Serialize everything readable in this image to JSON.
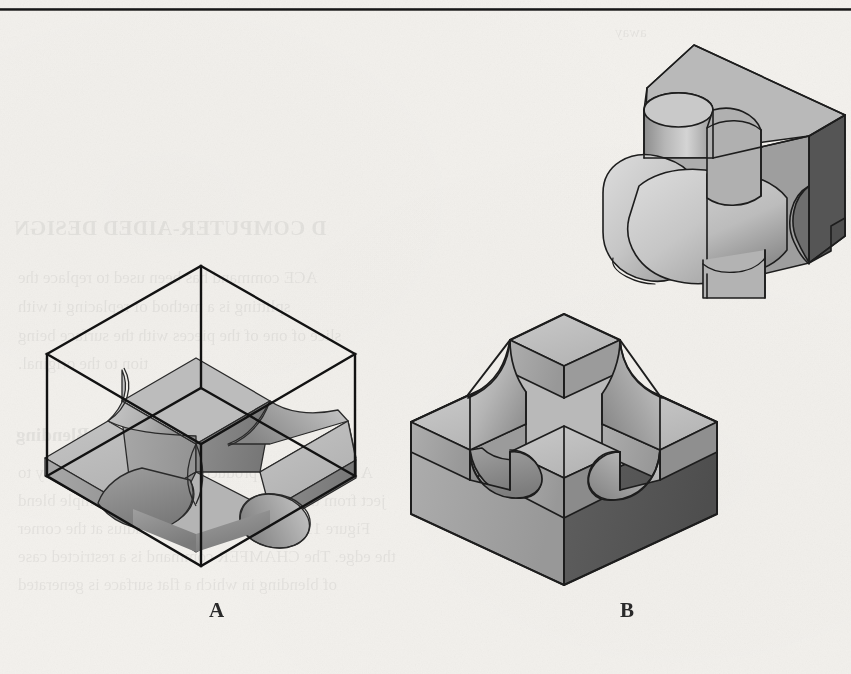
{
  "page": {
    "background_color": "#f3f1ed",
    "rule_color": "#151515",
    "width": 851,
    "height": 674
  },
  "figure": {
    "labels": [
      {
        "id": "label-a",
        "text": "A",
        "x": 209,
        "y": 598
      },
      {
        "id": "label-b",
        "text": "B",
        "x": 620,
        "y": 598
      }
    ],
    "objects": [
      {
        "id": "object-top-right",
        "name": "isometric-block-with-cylindrical-bosses",
        "description": "Isometric solid block with a vertical cylindrical boss and a horizontal cylindrical/spherical protrusion intersecting it"
      },
      {
        "id": "object-a",
        "name": "wireframe-cube-with-cross-solid",
        "description": "Isometric wireframe bounding cube enclosing a shaded plus/cross shaped solid with concave fillet cutouts"
      },
      {
        "id": "object-b",
        "name": "block-with-raised-cross-boss",
        "description": "Solid isometric rectangular block with a raised cross shaped boss and curved fillets at the corners"
      }
    ]
  },
  "shading": {
    "top_face": "#bdbdbd",
    "top_face_light": "#cfcfcf",
    "left_face": "#a2a2a2",
    "left_face_dark": "#8e8e8e",
    "right_face": "#5a5a5a",
    "right_face_dark": "#4d4d4d",
    "curve_light": "#d2d2d2",
    "curve_dark": "#8b8b8b",
    "outline": "#1e1e1e",
    "wire": "#141414"
  },
  "ghost_text": {
    "note": "Faint show-through text from the reverse side of the printed page",
    "lines": [
      {
        "text": "D COMPUTER-AIDED DESIGN",
        "x": 14,
        "y": 216,
        "size": 21,
        "style": "head"
      },
      {
        "text": "ACE command has been used to replace the",
        "x": 18,
        "y": 268,
        "size": 17,
        "style": ""
      },
      {
        "text": "splitting is a method of replacing it with",
        "x": 18,
        "y": 297,
        "size": 17,
        "style": ""
      },
      {
        "text": "slice of one of the pieces with the surface being",
        "x": 18,
        "y": 326,
        "size": 17,
        "style": ""
      },
      {
        "text": "tion to the original.",
        "x": 18,
        "y": 354,
        "size": 17,
        "style": ""
      },
      {
        "text": "Blending",
        "x": 16,
        "y": 424,
        "size": 19,
        "style": "h2"
      },
      {
        "text": "A technique that produces a shape that is not easy to",
        "x": 18,
        "y": 463,
        "size": 17,
        "style": ""
      },
      {
        "text": "ject from the shape of its edge. One very simple blend",
        "x": 18,
        "y": 491,
        "size": 17,
        "style": ""
      },
      {
        "text": "Figure 11.10.A. The plane has a radius at the corner",
        "x": 18,
        "y": 519,
        "size": 17,
        "style": ""
      },
      {
        "text": "the edge. The CHAMFER command is a restricted case",
        "x": 18,
        "y": 547,
        "size": 17,
        "style": ""
      },
      {
        "text": "of blending in which a flat surface is generated",
        "x": 18,
        "y": 575,
        "size": 17,
        "style": ""
      },
      {
        "text": "away",
        "x": 615,
        "y": 24,
        "size": 15,
        "style": ""
      }
    ]
  }
}
